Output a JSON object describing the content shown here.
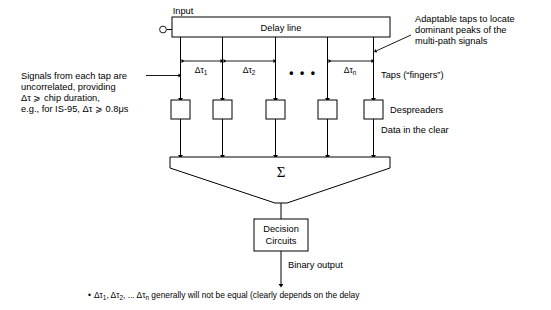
{
  "diagram": {
    "colors": {
      "line": "#000000",
      "background": "#ffffff",
      "box_fill": "#ffffff"
    },
    "input": {
      "label": "Input",
      "terminal": "open-circle"
    },
    "delay_line": {
      "label": "Delay line"
    },
    "taps": {
      "count": 5,
      "ellipsis": "• • •",
      "spacing_labels": [
        {
          "delta": "Δτ",
          "sub": "1"
        },
        {
          "delta": "Δτ",
          "sub": "2"
        },
        {
          "delta": "Δτ",
          "sub": "n"
        }
      ],
      "taps_label": "Taps (“fingers”)"
    },
    "despreaders": {
      "label": "Despreaders",
      "count": 5
    },
    "data_clear": {
      "label": "Data in the clear"
    },
    "summation": {
      "symbol": "Σ"
    },
    "decision": {
      "line1": "Decision",
      "line2": "Circuits"
    },
    "output": {
      "label": "Binary output"
    },
    "annotations": {
      "left": {
        "lines": [
          "Signals from each tap are",
          "uncorrelated, providing",
          "Δτ ⩾ chip duration,",
          "e.g., for IS-95, Δτ ⩾ 0.8μs"
        ]
      },
      "right_top": {
        "lines": [
          "Adaptable taps to locate",
          "dominant peaks of the",
          "multi-path signals"
        ]
      }
    },
    "footnote": {
      "bullet": "•",
      "parts": {
        "p1": "Δτ",
        "s1": "1",
        "p2": ", Δτ",
        "s2": "2",
        "p3": ", ... Δτ",
        "s3": "n",
        "p4": " generally will not be equal (clearly depends on the delay"
      }
    }
  }
}
